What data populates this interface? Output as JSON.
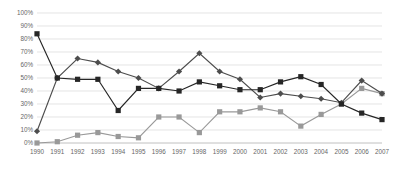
{
  "chart_data": {
    "type": "line",
    "title": "",
    "subtitle": "",
    "xlabel": "",
    "ylabel": "",
    "ylim": [
      0,
      100
    ],
    "ytick_labels": [
      "0%",
      "10%",
      "20%",
      "30%",
      "40%",
      "50%",
      "60%",
      "70%",
      "80%",
      "90%",
      "100%"
    ],
    "ytick_values": [
      0,
      10,
      20,
      30,
      40,
      50,
      60,
      70,
      80,
      90,
      100
    ],
    "grid": true,
    "grid_axis": "y",
    "legend": false,
    "legend_position": "none",
    "annotations": [],
    "categories": [
      "1990",
      "1991",
      "1992",
      "1993",
      "1994",
      "1995",
      "1996",
      "1997",
      "1998",
      "1999",
      "2000",
      "2001",
      "2002",
      "2003",
      "2004",
      "2005",
      "2006",
      "2007"
    ],
    "x": [
      1990,
      1991,
      1992,
      1993,
      1994,
      1995,
      1996,
      1997,
      1998,
      1999,
      2000,
      2001,
      2002,
      2003,
      2004,
      2005,
      2006,
      2007
    ],
    "series": [
      {
        "name": "series-1",
        "color": "#262626",
        "marker": "square",
        "values": [
          84,
          50,
          49,
          49,
          25,
          42,
          42,
          40,
          47,
          44,
          41,
          41,
          47,
          51,
          45,
          30,
          23,
          18
        ]
      },
      {
        "name": "series-2",
        "color": "#4d4d4d",
        "marker": "diamond",
        "values": [
          9,
          50,
          65,
          62,
          55,
          50,
          42,
          55,
          69,
          55,
          49,
          35,
          38,
          36,
          34,
          31,
          48,
          38
        ]
      },
      {
        "name": "series-3",
        "color": "#999999",
        "marker": "square",
        "values": [
          0,
          1,
          6,
          8,
          5,
          4,
          20,
          20,
          8,
          24,
          24,
          27,
          24,
          13,
          22,
          30,
          42,
          38
        ]
      }
    ]
  },
  "geometry": {
    "plot_left": 37,
    "plot_right": 382,
    "plot_top": 13,
    "plot_bottom": 143,
    "marker_size": 2.6,
    "line_width": 1.15
  }
}
